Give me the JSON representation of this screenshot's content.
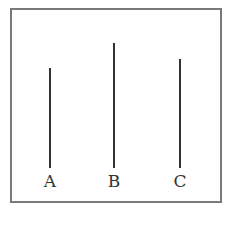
{
  "diagram": {
    "frame": {
      "border_color": "#7a7a7a"
    },
    "sticks": [
      {
        "label": "A",
        "x": 49,
        "top": 68,
        "bottom": 168
      },
      {
        "label": "B",
        "x": 113,
        "top": 43,
        "bottom": 168
      },
      {
        "label": "C",
        "x": 179,
        "top": 59,
        "bottom": 168
      }
    ],
    "line_color": "#333333"
  }
}
